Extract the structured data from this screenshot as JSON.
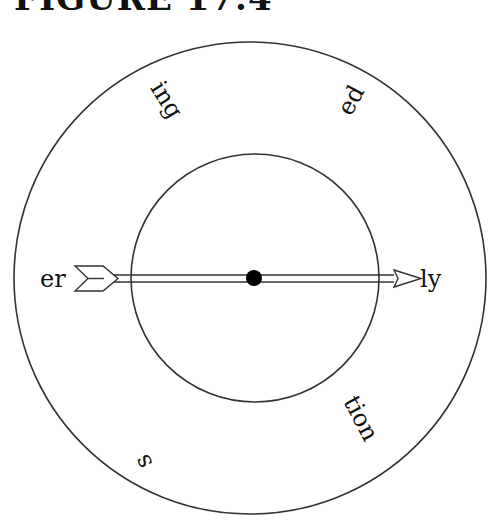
{
  "figure": {
    "title": "FIGURE 17.4",
    "title_visibility": "partially clipped at top edge; only lower half of glyphs visible"
  },
  "spinner": {
    "outer_circle": {
      "cx": 250,
      "cy": 278,
      "r": 236
    },
    "inner_circle": {
      "cx": 255,
      "cy": 278,
      "r": 124
    },
    "center_dot": {
      "cx": 254,
      "cy": 278,
      "r": 8
    },
    "arrow": {
      "direction": "pointing right",
      "tail_label": "er",
      "head_label": "ly"
    },
    "labels": [
      {
        "id": "ing",
        "text": "ing",
        "x": 160,
        "y": 104,
        "rotate": 58
      },
      {
        "id": "ed",
        "text": "ed",
        "x": 356,
        "y": 102,
        "rotate": -62
      },
      {
        "id": "er",
        "text": "er",
        "x": 40,
        "y": 286,
        "rotate": 0
      },
      {
        "id": "ly",
        "text": "ly",
        "x": 418,
        "y": 286,
        "rotate": 0
      },
      {
        "id": "tion",
        "text": "tion",
        "x": 352,
        "y": 420,
        "rotate": 62
      },
      {
        "id": "s",
        "text": "s",
        "x": 150,
        "y": 458,
        "rotate": -118
      }
    ]
  },
  "colors": {
    "stroke": "#333333",
    "text": "#111111",
    "dot": "#000000",
    "background": "#ffffff"
  }
}
